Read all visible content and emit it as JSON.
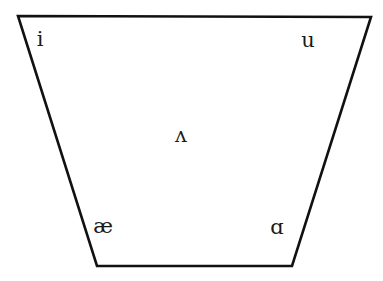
{
  "diagram": {
    "title": "",
    "shape": "vowel-trapezoid",
    "line_color": "#111111",
    "vowels": [
      {
        "symbol": "i",
        "position": "close-front"
      },
      {
        "symbol": "u",
        "position": "close-back"
      },
      {
        "symbol": "ʌ",
        "position": "mid-central"
      },
      {
        "symbol": "æ",
        "position": "open-front"
      },
      {
        "symbol": "ɑ",
        "position": "open-back"
      }
    ]
  }
}
